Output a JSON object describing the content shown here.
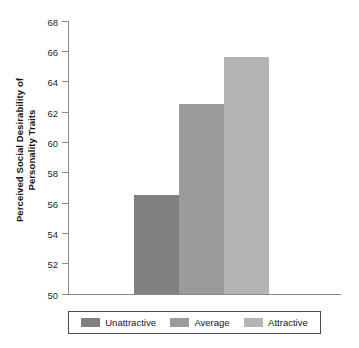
{
  "chart_data": {
    "type": "bar",
    "title": "",
    "subtitle": "",
    "xlabel": "",
    "ylabel": "Perceived Social Desirability of\nPersonality Traits",
    "ylabel_line1": "Perceived Social Desirability of",
    "ylabel_line2": "Personality Traits",
    "categories": [
      "Unattractive",
      "Average",
      "Attractive"
    ],
    "values": [
      56.5,
      62.5,
      65.6
    ],
    "series": [
      {
        "name": "Perceived Social Desirability",
        "values": [
          56.5,
          62.5,
          65.6
        ]
      }
    ],
    "ylim": [
      50,
      68
    ],
    "ytick_values": [
      50,
      52,
      54,
      56,
      58,
      60,
      62,
      64,
      66,
      68
    ],
    "ytick_labels": [
      "50",
      "52",
      "54",
      "56",
      "58",
      "60",
      "62",
      "64",
      "66",
      "68"
    ],
    "ytick_step": 2,
    "grid": false,
    "xaxis_tick_labels": [],
    "legend_position": "bottom",
    "bar_colors": [
      "#808080",
      "#9b9b9b",
      "#b4b4b4"
    ],
    "axis_color": "#8a8a8a",
    "background_color": "#ffffff",
    "text_color": "#141414"
  },
  "legend": {
    "entries": [
      {
        "label": "Unattractive",
        "color": "#808080"
      },
      {
        "label": "Average",
        "color": "#9b9b9b"
      },
      {
        "label": "Attractive",
        "color": "#b4b4b4"
      }
    ]
  }
}
